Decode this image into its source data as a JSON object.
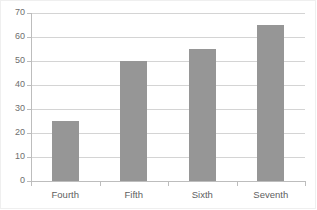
{
  "chart_data": {
    "type": "bar",
    "title": "",
    "subtitle": "",
    "xlabel": "",
    "ylabel": "",
    "categories": [
      "Fourth",
      "Fifth",
      "Sixth",
      "Seventh"
    ],
    "values": [
      25,
      50,
      55,
      65
    ],
    "series": [
      {
        "name": "Series 1",
        "values": [
          25,
          50,
          55,
          65
        ]
      }
    ],
    "ylim": [
      0,
      70
    ],
    "ytick_step": 10,
    "ytick_labels": [
      "0",
      "10",
      "20",
      "30",
      "40",
      "50",
      "60",
      "70"
    ],
    "ytick_values": [
      0,
      10,
      20,
      30,
      40,
      50,
      60,
      70
    ],
    "grid": "horizontal",
    "legend": "none",
    "bar_color": "#969696",
    "gridline_color": "#d4d4d4",
    "axis_color": "#bdbdbd",
    "plot_background": "#ffffff",
    "annotations": []
  }
}
